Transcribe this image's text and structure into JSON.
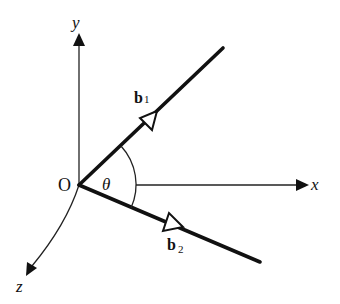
{
  "diagram": {
    "origin_label": "O",
    "angle_label": "θ",
    "axes": {
      "x": {
        "label": "x"
      },
      "y": {
        "label": "y"
      },
      "z": {
        "label": "z"
      }
    },
    "vectors": [
      {
        "name": "b",
        "subscript": "1"
      },
      {
        "name": "b",
        "subscript": "2"
      }
    ],
    "colors": {
      "stroke": "#111111",
      "background": "#ffffff"
    }
  }
}
